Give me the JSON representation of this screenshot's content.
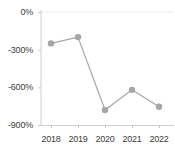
{
  "chart_data": {
    "type": "line",
    "title": "",
    "subtitle": "",
    "xlabel": "",
    "ylabel": "",
    "categories": [
      "2018",
      "2019",
      "2020",
      "2021",
      "2022"
    ],
    "values": [
      -250,
      -200,
      -780,
      -620,
      -755
    ],
    "series": [
      {
        "name": "",
        "values": [
          -250,
          -200,
          -780,
          -620,
          -755
        ]
      }
    ],
    "ylim": [
      -900,
      0
    ],
    "y_ticks": [
      0,
      -300,
      -600,
      -900
    ],
    "y_tick_labels": [
      "0%",
      "-300%",
      "-600%",
      "-900%"
    ],
    "x_tick_labels": [
      "2018",
      "2019",
      "2020",
      "2021",
      "2022"
    ],
    "grid": false,
    "legend": "none",
    "value_suffix": "%"
  },
  "style": {
    "line_color": "#a6a6a6",
    "marker_color": "#a6a6a6",
    "axis_color": "#d0d0d0",
    "tick_color": "#c8c8c8",
    "label_color": "#3c3c3c",
    "background": "#ffffff",
    "gridline_color": "#ececec"
  }
}
